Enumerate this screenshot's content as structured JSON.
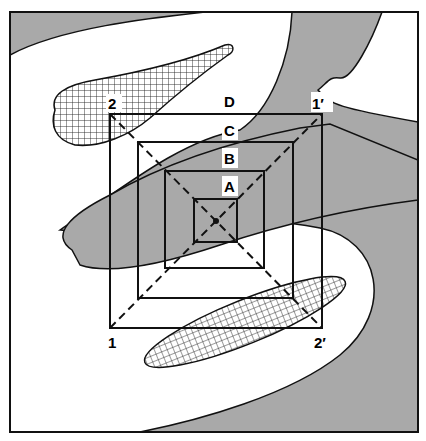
{
  "figure": {
    "type": "nested-squares-sampling-diagram",
    "colors": {
      "background": "#ffffff",
      "shaded_region": "#a9a9a9",
      "line": "#111111",
      "hatch": "#222222"
    }
  },
  "squares": [
    {
      "id": "A",
      "label": "A"
    },
    {
      "id": "B",
      "label": "B"
    },
    {
      "id": "C",
      "label": "C"
    },
    {
      "id": "D",
      "label": "D"
    }
  ],
  "corner_labels": {
    "top_left": "2",
    "top_right": "1′",
    "bottom_left": "1",
    "bottom_right": "2′"
  },
  "legend": {
    "shaded": "gray shaded region",
    "hatched": "cross-hatched region"
  }
}
